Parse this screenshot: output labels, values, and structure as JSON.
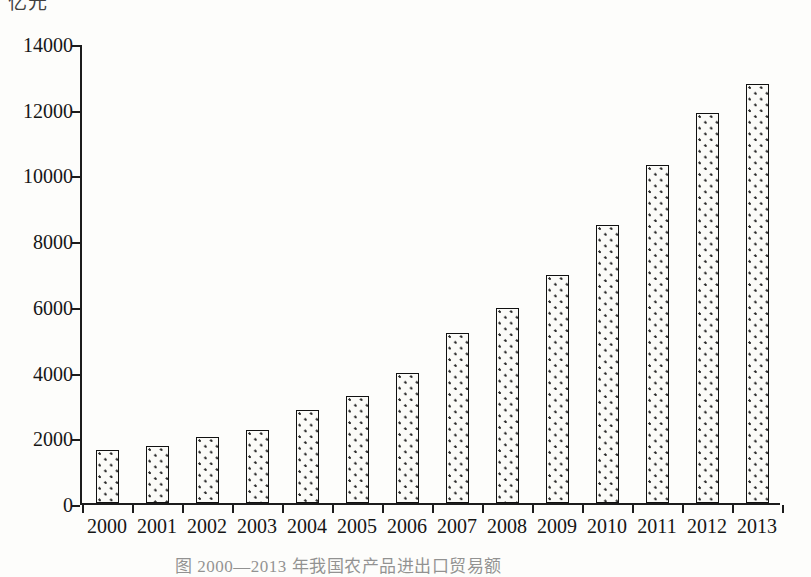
{
  "labels": {
    "axis_unit_label": "亿元",
    "figure_caption": "图 2000—2013 年我国农产品进出口贸易额"
  },
  "chart_data": {
    "type": "bar",
    "title": "",
    "subtitle": "",
    "xlabel": "",
    "ylabel": "亿元",
    "categories": [
      "2000",
      "2001",
      "2002",
      "2003",
      "2004",
      "2005",
      "2006",
      "2007",
      "2008",
      "2009",
      "2010",
      "2011",
      "2012",
      "2013"
    ],
    "values": [
      1610,
      1750,
      2000,
      2220,
      2830,
      3260,
      3960,
      5170,
      5930,
      6940,
      8450,
      10300,
      11860,
      12750
    ],
    "ylim": [
      0,
      14000
    ],
    "ytick_values": [
      0,
      2000,
      4000,
      6000,
      8000,
      10000,
      12000,
      14000
    ],
    "ytick_labels": [
      "0",
      "2000",
      "4000",
      "6000",
      "8000",
      "10000",
      "12000",
      "14000"
    ],
    "grid": false,
    "legend": null,
    "legend_position": "none",
    "bar_fill": "dotted-stipple",
    "bar_outline_color": "#111111",
    "background_color": "#fdfdfb",
    "annotations": []
  }
}
